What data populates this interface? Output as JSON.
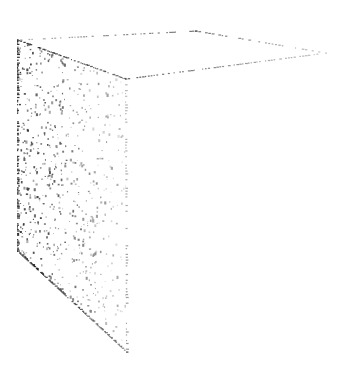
{
  "figure": {
    "background": "#ffffff",
    "ink_color": "#1a1a1a",
    "top_face": {
      "points": [
        [
          17,
          40
        ],
        [
          195,
          31
        ],
        [
          325,
          53
        ],
        [
          125,
          79
        ]
      ]
    },
    "side_face": {
      "points": [
        [
          17,
          40
        ],
        [
          125,
          79
        ],
        [
          126,
          352
        ],
        [
          17,
          251
        ]
      ]
    }
  }
}
